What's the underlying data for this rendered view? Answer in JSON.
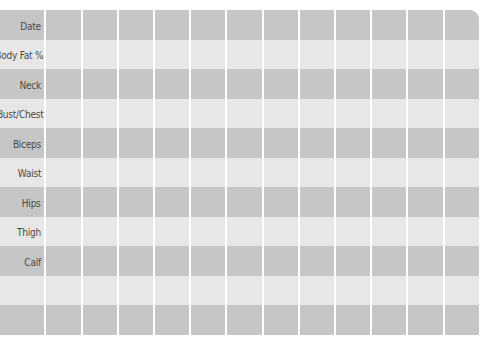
{
  "tracker": {
    "columns_count": 12,
    "colors": {
      "row_dark": "#c6c6c6",
      "row_light": "#e7e7e7",
      "gridline": "#ffffff",
      "label_text": "#4a4a4a"
    },
    "rows": [
      {
        "label": "Date"
      },
      {
        "label": "Body Fat %"
      },
      {
        "label": "Neck"
      },
      {
        "label": "Bust/Chest"
      },
      {
        "label": "Biceps"
      },
      {
        "label": "Waist"
      },
      {
        "label": "Hips"
      },
      {
        "label": "Thigh"
      },
      {
        "label": "Calf"
      },
      {
        "label": ""
      },
      {
        "label": ""
      }
    ]
  }
}
